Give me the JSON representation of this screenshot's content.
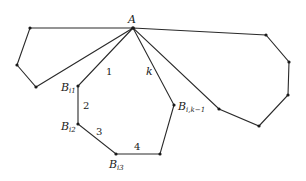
{
  "diagram": {
    "apex": {
      "label": "A",
      "x": 133,
      "y": 28
    },
    "left_polygon": [
      [
        133,
        28
      ],
      [
        30,
        28
      ],
      [
        17,
        65
      ],
      [
        36,
        87
      ]
    ],
    "center_path": [
      [
        133,
        28
      ],
      [
        78,
        86
      ],
      [
        78,
        124
      ],
      [
        116,
        154
      ],
      [
        160,
        154
      ],
      [
        174,
        105
      ]
    ],
    "right_polygon": [
      [
        133,
        28
      ],
      [
        266,
        35
      ],
      [
        289,
        62
      ],
      [
        288,
        95
      ],
      [
        259,
        126
      ],
      [
        219,
        109
      ]
    ],
    "labels": {
      "A": "A",
      "B": "B",
      "bi1_sub": "i1",
      "bi2_sub": "i2",
      "bi3_sub": "i3",
      "bik_sub": "i,k−1",
      "edge1": "1",
      "edge2": "2",
      "edge3": "3",
      "edge4": "4",
      "edgek": "k"
    }
  }
}
